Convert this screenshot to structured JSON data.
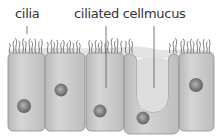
{
  "diagram": {
    "labels": {
      "cilia": "cilia",
      "ciliated_cell": "ciliated cell",
      "mucus": "mucus"
    },
    "colors": {
      "cell_fill": "#c9c9c9",
      "cell_stroke": "#8a8a8a",
      "mucus_fill": "#e2e2e2",
      "nucleus": "#7a7a7a",
      "cilia": "#444444",
      "leader_line": "#555555"
    }
  }
}
